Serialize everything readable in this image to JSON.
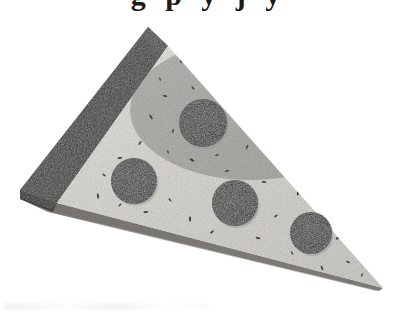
{
  "image": {
    "subject": "pizza-slice",
    "rendering": "grayscale halftone photograph on white background",
    "width": 417,
    "height": 321,
    "background_color": "#ffffff"
  },
  "top_clipped_text": {
    "note": "bottom edge of a cropped line of bold serif text, only descenders visible",
    "glyphs": "g p y j y"
  },
  "palette": {
    "crust_dark": "#3a3835",
    "crust_shadow": "#262523",
    "cheese_light": "#d9d7d2",
    "cheese_highlight": "#e8e6e1",
    "cheese_speckle": "#4a4845",
    "edge_side": "#8e8c88",
    "edge_side_dark": "#5d5b58",
    "pepperoni_dark": "#201f1d",
    "pepperoni_speckle": "#6b6966",
    "background": "#ffffff"
  },
  "geometry": {
    "apex": {
      "x": 148,
      "y": 27
    },
    "left_corner": {
      "x": 20,
      "y": 190
    },
    "tip": {
      "x": 383,
      "y": 288
    },
    "crust_inner_top": {
      "x": 168,
      "y": 46
    },
    "crust_inner_bottom": {
      "x": 57,
      "y": 203
    }
  },
  "parts": [
    {
      "name": "crust",
      "label": "Crust",
      "color": "#3a3835"
    },
    {
      "name": "cheese-surface",
      "label": "Cheese surface",
      "color": "#d9d7d2"
    },
    {
      "name": "side-edge",
      "label": "Side edge",
      "color": "#8e8c88"
    }
  ],
  "pepperoni": [
    {
      "id": 1,
      "label": "Pepperoni 1",
      "cx": 203,
      "cy": 123,
      "r": 24
    },
    {
      "id": 2,
      "label": "Pepperoni 2",
      "cx": 134,
      "cy": 181,
      "r": 23
    },
    {
      "id": 3,
      "label": "Pepperoni 3",
      "cx": 235,
      "cy": 203,
      "r": 23
    },
    {
      "id": 4,
      "label": "Pepperoni 4",
      "cx": 311,
      "cy": 233,
      "r": 21
    }
  ],
  "pepperoni_count": 4,
  "speckles": [
    {
      "x": 181,
      "y": 61,
      "r": 1.3
    },
    {
      "x": 200,
      "y": 72,
      "r": 1.0
    },
    {
      "x": 222,
      "y": 68,
      "r": 1.5
    },
    {
      "x": 193,
      "y": 88,
      "r": 1.1
    },
    {
      "x": 232,
      "y": 93,
      "r": 1.4
    },
    {
      "x": 247,
      "y": 80,
      "r": 1.0
    },
    {
      "x": 165,
      "y": 96,
      "r": 1.2
    },
    {
      "x": 151,
      "y": 117,
      "r": 1.4
    },
    {
      "x": 173,
      "y": 131,
      "r": 1.1
    },
    {
      "x": 240,
      "y": 120,
      "r": 1.3
    },
    {
      "x": 258,
      "y": 108,
      "r": 1.0
    },
    {
      "x": 268,
      "y": 132,
      "r": 1.5
    },
    {
      "x": 247,
      "y": 147,
      "r": 1.2
    },
    {
      "x": 217,
      "y": 155,
      "r": 1.1
    },
    {
      "x": 192,
      "y": 160,
      "r": 1.4
    },
    {
      "x": 168,
      "y": 152,
      "r": 1.0
    },
    {
      "x": 140,
      "y": 143,
      "r": 1.2
    },
    {
      "x": 120,
      "y": 158,
      "r": 1.3
    },
    {
      "x": 104,
      "y": 175,
      "r": 1.1
    },
    {
      "x": 98,
      "y": 196,
      "r": 1.4
    },
    {
      "x": 120,
      "y": 205,
      "r": 1.0
    },
    {
      "x": 146,
      "y": 212,
      "r": 1.3
    },
    {
      "x": 170,
      "y": 200,
      "r": 1.1
    },
    {
      "x": 190,
      "y": 219,
      "r": 1.5
    },
    {
      "x": 212,
      "y": 232,
      "r": 1.2
    },
    {
      "x": 264,
      "y": 182,
      "r": 1.3
    },
    {
      "x": 286,
      "y": 166,
      "r": 1.0
    },
    {
      "x": 298,
      "y": 193,
      "r": 1.4
    },
    {
      "x": 276,
      "y": 216,
      "r": 1.1
    },
    {
      "x": 258,
      "y": 238,
      "r": 1.3
    },
    {
      "x": 292,
      "y": 253,
      "r": 1.0
    },
    {
      "x": 320,
      "y": 205,
      "r": 1.2
    },
    {
      "x": 338,
      "y": 238,
      "r": 1.4
    },
    {
      "x": 348,
      "y": 262,
      "r": 1.1
    },
    {
      "x": 322,
      "y": 268,
      "r": 1.3
    },
    {
      "x": 362,
      "y": 275,
      "r": 1.0
    },
    {
      "x": 227,
      "y": 171,
      "r": 1.2
    },
    {
      "x": 205,
      "y": 100,
      "r": 1.1
    },
    {
      "x": 160,
      "y": 79,
      "r": 1.0
    },
    {
      "x": 238,
      "y": 258,
      "r": 1.2
    }
  ]
}
